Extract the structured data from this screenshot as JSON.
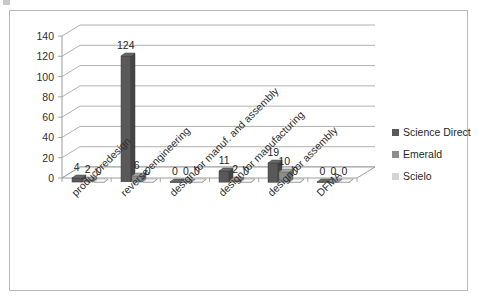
{
  "chart_data": {
    "type": "bar",
    "title": "",
    "subtitle": "",
    "xlabel": "",
    "ylabel": "",
    "ylim": [
      0,
      140
    ],
    "yticks": [
      0,
      20,
      40,
      60,
      80,
      100,
      120,
      140
    ],
    "grid": true,
    "legend_position": "right",
    "style": "3d-clustered-column",
    "categories": [
      "product redesign",
      "reverse engineering",
      "design for manuf. and assembly",
      "design for manufacturing",
      "design for assembly",
      "DFMA"
    ],
    "series": [
      {
        "name": "Science Direct",
        "color": "#595959",
        "values": [
          4,
          124,
          0,
          11,
          19,
          0
        ]
      },
      {
        "name": "Emerald",
        "color": "#8c8c8c",
        "values": [
          2,
          6,
          0,
          2,
          10,
          0
        ]
      },
      {
        "name": "Scielo",
        "color": "#d4d4d4",
        "values": [
          0,
          0,
          0,
          0,
          0,
          0
        ]
      }
    ],
    "data_labels": [
      [
        "4",
        "2",
        "0"
      ],
      [
        "124",
        "6",
        "0"
      ],
      [
        "0",
        "0",
        "0"
      ],
      [
        "11",
        "2",
        "0"
      ],
      [
        "19",
        "10",
        "0"
      ],
      [
        "0",
        "0",
        "0"
      ]
    ]
  },
  "legend": {
    "items": [
      {
        "label": "Science Direct",
        "color": "#595959"
      },
      {
        "label": "Emerald",
        "color": "#8c8c8c"
      },
      {
        "label": "Scielo",
        "color": "#d4d4d4"
      }
    ]
  }
}
